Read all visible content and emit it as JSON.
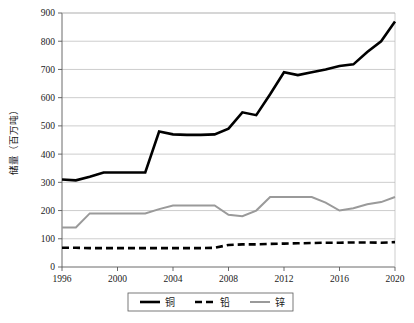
{
  "chart_data": {
    "type": "line",
    "title": "",
    "xlabel": "",
    "ylabel": "储量（百万吨）",
    "xlim": [
      1996,
      2020
    ],
    "ylim": [
      0,
      900
    ],
    "ytick_values": [
      0,
      100,
      200,
      300,
      400,
      500,
      600,
      700,
      800,
      900
    ],
    "ytick_labels": [
      "0",
      "100",
      "200",
      "300",
      "400",
      "500",
      "600",
      "700",
      "800",
      "900"
    ],
    "xtick_values": [
      1996,
      2000,
      2004,
      2008,
      2012,
      2016,
      2020
    ],
    "xtick_labels": [
      "1996",
      "2000",
      "2004",
      "2008",
      "2012",
      "2016",
      "2020"
    ],
    "x": [
      1996,
      1997,
      1998,
      1999,
      2000,
      2001,
      2002,
      2003,
      2004,
      2005,
      2006,
      2007,
      2008,
      2009,
      2010,
      2011,
      2012,
      2013,
      2014,
      2015,
      2016,
      2017,
      2018,
      2019,
      2020
    ],
    "grid": "horizontal",
    "legend_position": "bottom",
    "series": [
      {
        "name": "铜",
        "color": "#000000",
        "style": "solid",
        "width": 2.6,
        "values": [
          310,
          307,
          320,
          335,
          335,
          335,
          335,
          480,
          470,
          468,
          468,
          470,
          490,
          548,
          538,
          612,
          690,
          680,
          690,
          700,
          712,
          718,
          762,
          800,
          870
        ]
      },
      {
        "name": "铅",
        "color": "#000000",
        "style": "dashed",
        "width": 2.6,
        "values": [
          68,
          68,
          67,
          67,
          67,
          67,
          67,
          67,
          67,
          67,
          67,
          68,
          78,
          80,
          80,
          82,
          83,
          84,
          85,
          86,
          86,
          87,
          87,
          86,
          88
        ]
      },
      {
        "name": "锌",
        "color": "#9a9a9a",
        "style": "solid",
        "width": 2.0,
        "values": [
          140,
          140,
          190,
          190,
          190,
          190,
          190,
          205,
          218,
          218,
          218,
          218,
          185,
          180,
          200,
          248,
          248,
          248,
          248,
          228,
          200,
          208,
          222,
          230,
          248
        ]
      }
    ],
    "legend": [
      {
        "label": "铜",
        "color": "#000000",
        "style": "solid"
      },
      {
        "label": "铅",
        "color": "#000000",
        "style": "dashed"
      },
      {
        "label": "锌",
        "color": "#9a9a9a",
        "style": "solid"
      }
    ],
    "colors": {
      "axis": "#595959",
      "grid": "#b8b8b8",
      "copper": "#000000",
      "lead": "#000000",
      "zinc": "#9a9a9a",
      "background": "#ffffff",
      "text": "#1a1a1a"
    }
  }
}
